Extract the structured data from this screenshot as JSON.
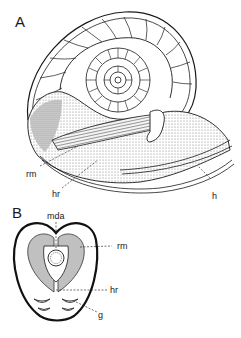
{
  "figure": {
    "panels": [
      {
        "id": "A",
        "label": "A",
        "description": "Nautilus shell cut in section showing chambered spiral and soft body",
        "annotations": [
          {
            "key": "rm",
            "text": "rm"
          },
          {
            "key": "hr",
            "text": "hr"
          },
          {
            "key": "h",
            "text": "h"
          }
        ]
      },
      {
        "id": "B",
        "label": "B",
        "description": "Cross-section of the body showing muscles and gills",
        "annotations": [
          {
            "key": "mda",
            "text": "mda"
          },
          {
            "key": "rm",
            "text": "rm"
          },
          {
            "key": "hr",
            "text": "hr"
          },
          {
            "key": "g",
            "text": "g"
          }
        ]
      }
    ]
  },
  "colors": {
    "ink": "#1a1a1a",
    "paper": "#ffffff",
    "stipple": "#9a9a9a",
    "stipple_dark": "#5a5a5a"
  }
}
